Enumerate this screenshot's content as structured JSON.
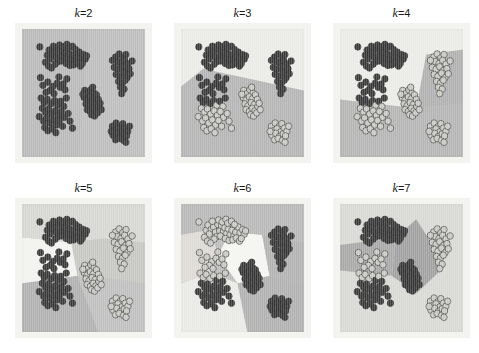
{
  "figure": {
    "width": 479,
    "height": 353,
    "background": "#ffffff",
    "layout": {
      "rows": 2,
      "cols": 3
    },
    "mat_color": "#f3f3f0"
  },
  "chart_data": {
    "type": "scatter",
    "title": "",
    "xlabel": "",
    "ylabel": "",
    "grid": false,
    "legend": null,
    "xlim": [
      0,
      100
    ],
    "ylim": [
      0,
      100
    ],
    "region_shades": [
      "#b9b9b9",
      "#e9e9e5",
      "#cfcfcb",
      "#a9a9a9",
      "#f2f2ef",
      "#c4c4c0",
      "#9d9d9d"
    ],
    "point_dark": "#3a3a3a",
    "point_light": "#c9c9c4",
    "point_outline": "#2e2e2e",
    "point_radius": 2.6,
    "clusters": [
      {
        "name": "top-left-arc",
        "cx": 30,
        "cy": 76,
        "n": 42
      },
      {
        "name": "lower-left-blob",
        "cx": 27,
        "cy": 32,
        "n": 40
      },
      {
        "name": "center-tight",
        "cx": 56,
        "cy": 44,
        "n": 26
      },
      {
        "name": "right-upper",
        "cx": 80,
        "cy": 68,
        "n": 26
      },
      {
        "name": "right-lower",
        "cx": 80,
        "cy": 20,
        "n": 20
      },
      {
        "name": "mid-left-sparse",
        "cx": 26,
        "cy": 50,
        "n": 12
      }
    ],
    "points": [
      [
        14.5,
        86.0
      ],
      [
        20.5,
        79.5
      ],
      [
        22.0,
        83.5
      ],
      [
        24.5,
        80.0
      ],
      [
        23.0,
        76.5
      ],
      [
        26.5,
        82.0
      ],
      [
        28.0,
        78.0
      ],
      [
        30.0,
        84.0
      ],
      [
        31.5,
        79.0
      ],
      [
        33.0,
        83.0
      ],
      [
        34.5,
        78.5
      ],
      [
        29.0,
        74.5
      ],
      [
        32.0,
        75.0
      ],
      [
        27.0,
        72.5
      ],
      [
        35.5,
        81.5
      ],
      [
        37.0,
        77.0
      ],
      [
        38.5,
        80.5
      ],
      [
        40.0,
        76.0
      ],
      [
        41.5,
        79.5
      ],
      [
        43.0,
        75.0
      ],
      [
        44.5,
        78.0
      ],
      [
        46.5,
        82.0
      ],
      [
        48.0,
        77.5
      ],
      [
        36.0,
        73.0
      ],
      [
        39.0,
        71.5
      ],
      [
        42.0,
        72.0
      ],
      [
        45.0,
        73.5
      ],
      [
        47.5,
        71.0
      ],
      [
        25.5,
        86.5
      ],
      [
        30.5,
        87.5
      ],
      [
        33.5,
        86.0
      ],
      [
        36.5,
        88.0
      ],
      [
        38.0,
        85.0
      ],
      [
        41.0,
        86.5
      ],
      [
        43.5,
        84.0
      ],
      [
        19.0,
        74.0
      ],
      [
        21.5,
        71.0
      ],
      [
        24.0,
        69.5
      ],
      [
        50.0,
        80.0
      ],
      [
        51.5,
        76.5
      ],
      [
        49.0,
        73.0
      ],
      [
        52.5,
        79.0
      ],
      [
        17.0,
        56.0
      ],
      [
        21.0,
        58.5
      ],
      [
        25.0,
        55.0
      ],
      [
        28.5,
        57.5
      ],
      [
        23.0,
        52.0
      ],
      [
        31.0,
        54.5
      ],
      [
        19.5,
        50.5
      ],
      [
        26.0,
        49.5
      ],
      [
        33.5,
        57.0
      ],
      [
        35.0,
        52.5
      ],
      [
        15.5,
        46.0
      ],
      [
        18.0,
        42.5
      ],
      [
        20.5,
        45.0
      ],
      [
        23.5,
        41.5
      ],
      [
        26.5,
        44.0
      ],
      [
        29.0,
        40.5
      ],
      [
        31.5,
        43.5
      ],
      [
        34.0,
        39.5
      ],
      [
        16.5,
        38.0
      ],
      [
        19.0,
        35.0
      ],
      [
        21.5,
        37.5
      ],
      [
        24.0,
        33.5
      ],
      [
        27.0,
        36.0
      ],
      [
        29.5,
        32.5
      ],
      [
        32.0,
        35.5
      ],
      [
        34.5,
        31.0
      ],
      [
        14.0,
        31.5
      ],
      [
        17.5,
        28.0
      ],
      [
        20.0,
        30.5
      ],
      [
        22.5,
        26.5
      ],
      [
        25.5,
        29.0
      ],
      [
        28.0,
        25.0
      ],
      [
        30.5,
        28.5
      ],
      [
        33.0,
        24.0
      ],
      [
        18.5,
        23.0
      ],
      [
        21.0,
        20.5
      ],
      [
        24.5,
        22.0
      ],
      [
        27.5,
        19.0
      ],
      [
        36.0,
        46.0
      ],
      [
        37.5,
        34.0
      ],
      [
        39.0,
        28.0
      ],
      [
        41.0,
        22.5
      ],
      [
        15.0,
        62.0
      ],
      [
        30.0,
        62.5
      ],
      [
        36.5,
        61.0
      ],
      [
        51.0,
        52.0
      ],
      [
        53.5,
        49.5
      ],
      [
        56.0,
        52.5
      ],
      [
        58.5,
        50.0
      ],
      [
        50.5,
        46.5
      ],
      [
        53.0,
        44.5
      ],
      [
        55.5,
        47.0
      ],
      [
        58.0,
        45.5
      ],
      [
        60.5,
        48.5
      ],
      [
        52.0,
        41.5
      ],
      [
        54.5,
        40.0
      ],
      [
        57.0,
        42.5
      ],
      [
        59.5,
        41.0
      ],
      [
        62.0,
        45.0
      ],
      [
        53.0,
        37.0
      ],
      [
        55.5,
        35.5
      ],
      [
        58.0,
        38.0
      ],
      [
        60.0,
        36.0
      ],
      [
        62.5,
        39.5
      ],
      [
        56.5,
        33.0
      ],
      [
        59.0,
        32.0
      ],
      [
        61.5,
        34.5
      ],
      [
        63.5,
        42.0
      ],
      [
        64.5,
        37.0
      ],
      [
        49.5,
        49.0
      ],
      [
        57.5,
        54.5
      ],
      [
        76.0,
        78.0
      ],
      [
        79.0,
        80.5
      ],
      [
        82.0,
        77.5
      ],
      [
        84.5,
        80.0
      ],
      [
        77.5,
        74.5
      ],
      [
        80.5,
        73.0
      ],
      [
        83.5,
        75.5
      ],
      [
        86.0,
        72.5
      ],
      [
        75.0,
        70.0
      ],
      [
        78.0,
        68.5
      ],
      [
        81.0,
        70.5
      ],
      [
        84.0,
        67.5
      ],
      [
        87.0,
        69.0
      ],
      [
        76.5,
        64.5
      ],
      [
        79.5,
        63.0
      ],
      [
        82.5,
        65.5
      ],
      [
        85.5,
        62.0
      ],
      [
        88.0,
        65.0
      ],
      [
        78.5,
        59.0
      ],
      [
        81.5,
        57.5
      ],
      [
        84.0,
        60.0
      ],
      [
        80.0,
        54.5
      ],
      [
        83.0,
        53.0
      ],
      [
        81.0,
        49.5
      ],
      [
        89.5,
        75.0
      ],
      [
        73.5,
        75.5
      ],
      [
        73.5,
        24.0
      ],
      [
        76.5,
        26.5
      ],
      [
        79.5,
        23.5
      ],
      [
        82.0,
        26.0
      ],
      [
        75.0,
        20.5
      ],
      [
        78.0,
        22.0
      ],
      [
        81.0,
        19.5
      ],
      [
        84.0,
        22.5
      ],
      [
        74.0,
        17.0
      ],
      [
        77.0,
        18.5
      ],
      [
        80.0,
        16.0
      ],
      [
        83.0,
        18.0
      ],
      [
        86.0,
        20.0
      ],
      [
        76.0,
        13.5
      ],
      [
        79.0,
        14.5
      ],
      [
        82.5,
        13.0
      ],
      [
        85.0,
        16.5
      ],
      [
        87.5,
        24.0
      ],
      [
        72.5,
        20.0
      ],
      [
        84.5,
        11.5
      ]
    ]
  },
  "panels": [
    {
      "id": "k2",
      "k": 2,
      "title_k": "k",
      "title_eq": "=2",
      "clusters_shown": 2,
      "regions": [
        {
          "id": "r1",
          "shade": "#b9b9b9",
          "polygon": "0,0 54,0 46,100 0,100"
        },
        {
          "id": "r2",
          "shade": "#bdbdbd",
          "polygon": "54,0 100,0 100,100 46,100"
        }
      ],
      "point_fill": [
        "#3a3a3a",
        "#3a3a3a"
      ]
    },
    {
      "id": "k3",
      "k": 3,
      "title_k": "k",
      "title_eq": "=3",
      "clusters_shown": 3,
      "regions": [
        {
          "id": "r1",
          "shade": "#b4b4b4",
          "polygon": "0,100 60,100 18,31 0,45"
        },
        {
          "id": "r2",
          "shade": "#b4b4b4",
          "polygon": "60,100 100,100 100,48 18,31 60,100"
        },
        {
          "id": "r3",
          "shade": "#eaeae6",
          "polygon": "0,45 18,31 100,48 100,0 0,0"
        }
      ],
      "point_fill": [
        "#3a3a3a",
        "#3a3a3a",
        "#c9c9c4"
      ]
    },
    {
      "id": "k4",
      "k": 4,
      "title_k": "k",
      "title_eq": "=4",
      "clusters_shown": 4,
      "regions": [
        {
          "id": "r1",
          "shade": "#b4b4b4",
          "polygon": "0,100 100,100 100,58 62,62 0,55"
        },
        {
          "id": "r2",
          "shade": "#b0b0b0",
          "polygon": "100,58 62,62 70,20 100,16"
        },
        {
          "id": "r3",
          "shade": "#eaeae6",
          "polygon": "0,55 62,62 70,20 100,16 100,0 0,0"
        }
      ],
      "point_fill": [
        "#3a3a3a",
        "#c9c9c4",
        "#c9c9c4",
        "#c9c9c4"
      ]
    },
    {
      "id": "k5",
      "k": 5,
      "title_k": "k",
      "title_eq": "=5",
      "clusters_shown": 5,
      "regions": [
        {
          "id": "r1",
          "shade": "#b0b0b0",
          "polygon": "0,100 62,100 45,56 0,62"
        },
        {
          "id": "r2",
          "shade": "#bfbfbf",
          "polygon": "62,100 100,100 100,62 70,58 45,56"
        },
        {
          "id": "r3",
          "shade": "#c6c6c2",
          "polygon": "45,56 70,58 100,62 100,30 66,27 40,30"
        },
        {
          "id": "r4",
          "shade": "#f2f2ef",
          "polygon": "0,62 45,56 40,30 0,26"
        },
        {
          "id": "r5",
          "shade": "#d6d6d2",
          "polygon": "40,30 66,27 100,30 100,0 0,0 0,26"
        }
      ],
      "point_fill": [
        "#3a3a3a",
        "#c9c9c4",
        "#c9c9c4",
        "#3a3a3a",
        "#c9c9c4"
      ]
    },
    {
      "id": "k6",
      "k": 6,
      "title_k": "k",
      "title_eq": "=6",
      "clusters_shown": 6,
      "regions": [
        {
          "id": "r1",
          "shade": "#e9e9e5",
          "polygon": "0,100 54,100 46,62 24,54 0,62"
        },
        {
          "id": "r2",
          "shade": "#b0b0b0",
          "polygon": "54,100 100,100 100,64 72,56 46,62"
        },
        {
          "id": "r3",
          "shade": "#f4f4f1",
          "polygon": "46,62 72,56 66,24 40,22 30,40"
        },
        {
          "id": "r4",
          "shade": "#dddad6",
          "polygon": "0,62 24,54 30,40 24,20 0,24"
        },
        {
          "id": "r5",
          "shade": "#b8b8b8",
          "polygon": "0,24 24,20 40,22 66,24 100,30 100,0 0,0"
        },
        {
          "id": "r6",
          "shade": "#b2b2b2",
          "polygon": "100,30 66,24 72,56 100,64"
        }
      ],
      "point_fill": [
        "#c9c9c4",
        "#3a3a3a",
        "#3a3a3a",
        "#c9c9c4",
        "#3a3a3a",
        "#3a3a3a"
      ]
    },
    {
      "id": "k7",
      "k": 7,
      "title_k": "k",
      "title_eq": "=7",
      "clusters_shown": 7,
      "regions": [
        {
          "id": "r1",
          "shade": "#d8d8d4",
          "polygon": "0,0 100,0 100,100 0,100"
        },
        {
          "id": "r2",
          "shade": "#a8a8a8",
          "polygon": "0,52 42,56 46,26 0,32"
        },
        {
          "id": "r3",
          "shade": "#a0a0a0",
          "polygon": "42,56 62,70 86,48 62,12 46,26"
        }
      ],
      "point_fill": [
        "#3a3a3a",
        "#3a3a3a",
        "#3a3a3a",
        "#c9c9c4",
        "#c9c9c4",
        "#c9c9c4",
        "#c9c9c4"
      ]
    }
  ]
}
